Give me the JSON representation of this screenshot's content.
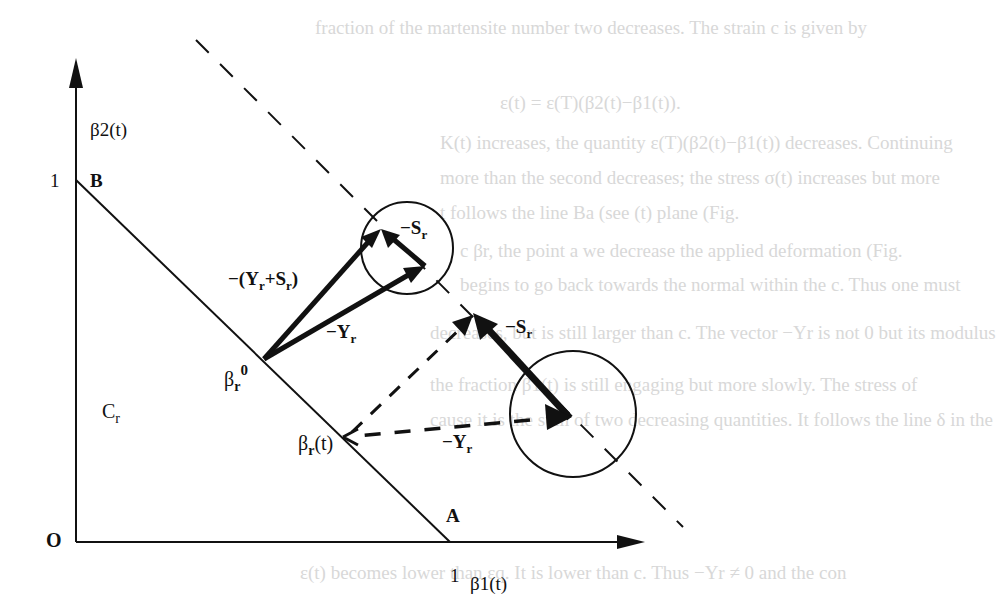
{
  "background_text": [
    {
      "text": "fraction of the martensite number two decreases. The strain c is given by",
      "x": 315,
      "y": 35
    },
    {
      "text": "ε(t) = ε(T)(β2(t)−β1(t)).",
      "x": 500,
      "y": 110
    },
    {
      "text": "K(t) increases, the quantity ε(T)(β2(t)−β1(t)) decreases. Continuing",
      "x": 440,
      "y": 150
    },
    {
      "text": "more than the second decreases; the stress σ(t) increases but more",
      "x": 440,
      "y": 185
    },
    {
      "text": "t follows the line Ba (see (t) plane (Fig.",
      "x": 440,
      "y": 220
    },
    {
      "text": "c βr, the point a we decrease the applied deformation (Fig.",
      "x": 460,
      "y": 258
    },
    {
      "text": "begins to go back towards the normal within the c. Thus one must",
      "x": 460,
      "y": 292
    },
    {
      "text": "decreases, but is still larger than c. The vector −Yr is not 0 but its modulus",
      "x": 430,
      "y": 340
    },
    {
      "text": "the fraction β1(t) is still engaging but more slowly. The stress of",
      "x": 430,
      "y": 392
    },
    {
      "text": "cause it is the sum of two decreasing quantities. It follows the line δ in the",
      "x": 430,
      "y": 427
    },
    {
      "text": "ε(t) becomes lower than εq. It is lower than c. Thus −Yr ≠ 0 and the con",
      "x": 300,
      "y": 580
    }
  ],
  "diagram": {
    "axes": {
      "y_label": "β2(t)",
      "x_label": "β1(t)",
      "origin_label": "O",
      "y_tick": "1",
      "x_tick": "1"
    },
    "points": {
      "B": "B",
      "A": "A",
      "beta_r0_base": "β",
      "beta_r0_sub": "r",
      "beta_r0_sup": "0",
      "beta_rt_base": "β",
      "beta_rt_sub": "r",
      "beta_rt_tail": "(t)",
      "region_base": "C",
      "region_sub": "r"
    },
    "vectors": {
      "minus_Y_plus_S": "−(Y",
      "minus_Y_plus_S_sub1": "r",
      "minus_Y_plus_S_mid": "+S",
      "minus_Y_plus_S_sub2": "r",
      "minus_Y_plus_S_end": ")",
      "minus_Y_top": "−Y",
      "minus_Y_top_sub": "r",
      "minus_S_top": "−S",
      "minus_S_top_sub": "r",
      "minus_S_right": "−S",
      "minus_S_right_sub": "r",
      "minus_Y_bottom": "−Y",
      "minus_Y_bottom_sub": "r"
    },
    "colors": {
      "ink": "#111111",
      "paper": "#ffffff",
      "bleed": "#d8d8d8"
    }
  }
}
